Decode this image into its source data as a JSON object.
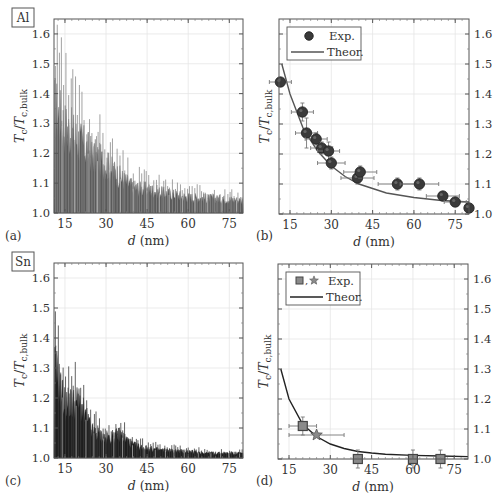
{
  "figure": {
    "panels": [
      {
        "id": "a",
        "label": "(a)",
        "material": "Al",
        "xlabel": "d (nm)",
        "ylabel": "Tc/Tc,bulk"
      },
      {
        "id": "b",
        "label": "(b)",
        "xlabel": "d (nm)",
        "ylabel": "Tc/Tc,bulk",
        "legend": [
          "Exp.",
          "Theor."
        ]
      },
      {
        "id": "c",
        "label": "(c)",
        "material": "Sn",
        "xlabel": "d (nm)",
        "ylabel": "Tc/Tc,bulk"
      },
      {
        "id": "d",
        "label": "(d)",
        "xlabel": "d (nm)",
        "ylabel": "Tc/Tc,bulk",
        "legend": [
          "Exp.",
          "Theor."
        ]
      }
    ]
  },
  "chart_data": [
    {
      "panel": "a",
      "type": "area",
      "title": "Al",
      "description": "Oscillating Tc/Tc,bulk vs film thickness (dense spiky curve, filled)",
      "xlabel": "d (nm)",
      "ylabel": "T_c / T_c,bulk",
      "xlim": [
        11,
        80
      ],
      "ylim": [
        1.0,
        1.65
      ],
      "xticks": [
        15,
        30,
        45,
        60,
        75
      ],
      "yticks": [
        1.0,
        1.1,
        1.2,
        1.3,
        1.4,
        1.5,
        1.6
      ],
      "grid": true,
      "envelope": {
        "x": [
          12,
          15,
          20,
          25,
          30,
          35,
          40,
          45,
          50,
          60,
          70,
          80
        ],
        "peak": [
          1.65,
          1.55,
          1.46,
          1.37,
          1.31,
          1.23,
          1.16,
          1.15,
          1.13,
          1.1,
          1.09,
          1.08
        ]
      }
    },
    {
      "panel": "b",
      "type": "scatter",
      "xlabel": "d (nm)",
      "ylabel": "T_c / T_c,bulk",
      "xlim": [
        11,
        80
      ],
      "ylim": [
        1.0,
        1.65
      ],
      "xticks": [
        15,
        30,
        45,
        60,
        75
      ],
      "yticks": [
        1.0,
        1.1,
        1.2,
        1.3,
        1.4,
        1.5,
        1.6
      ],
      "grid": true,
      "legend_position": "upper left",
      "series": [
        {
          "name": "Exp.",
          "marker": "circle",
          "x": [
            11.5,
            19.5,
            21,
            24.5,
            26.5,
            29,
            30,
            39.5,
            40.5,
            54,
            62,
            70.5,
            75,
            80
          ],
          "y": [
            1.44,
            1.34,
            1.27,
            1.25,
            1.22,
            1.21,
            1.17,
            1.12,
            1.14,
            1.1,
            1.1,
            1.06,
            1.04,
            1.02
          ],
          "xerr": [
            4,
            4,
            4,
            4,
            4,
            4,
            5,
            6,
            6,
            7,
            7,
            6,
            4,
            0
          ],
          "yerr": [
            0,
            0.03,
            0.05,
            0.02,
            0.02,
            0.03,
            0.02,
            0.02,
            0.02,
            0.02,
            0.02,
            0,
            0,
            0
          ]
        },
        {
          "name": "Theor.",
          "type": "line",
          "x": [
            12,
            15,
            20,
            25,
            30,
            35,
            40,
            45,
            50,
            60,
            70,
            80
          ],
          "y": [
            1.5,
            1.4,
            1.28,
            1.21,
            1.16,
            1.125,
            1.1,
            1.085,
            1.07,
            1.055,
            1.045,
            1.04
          ]
        }
      ]
    },
    {
      "panel": "c",
      "type": "area",
      "title": "Sn",
      "description": "Oscillating Tc/Tc,bulk vs film thickness (dense spiky curve, filled)",
      "xlabel": "d (nm)",
      "ylabel": "T_c / T_c,bulk",
      "xlim": [
        11,
        80
      ],
      "ylim": [
        1.0,
        1.65
      ],
      "xticks": [
        15,
        30,
        45,
        60,
        75
      ],
      "yticks": [
        1.0,
        1.1,
        1.2,
        1.3,
        1.4,
        1.5,
        1.6
      ],
      "grid": true,
      "envelope": {
        "x": [
          12,
          15,
          20,
          25,
          30,
          35,
          40,
          45,
          50,
          60,
          70,
          80
        ],
        "peak": [
          1.53,
          1.34,
          1.35,
          1.17,
          1.12,
          1.15,
          1.08,
          1.06,
          1.05,
          1.04,
          1.03,
          1.03
        ]
      }
    },
    {
      "panel": "d",
      "type": "scatter",
      "xlabel": "d (nm)",
      "ylabel": "T_c / T_c,bulk",
      "xlim": [
        11,
        80
      ],
      "ylim": [
        1.0,
        1.65
      ],
      "xticks": [
        15,
        30,
        45,
        60,
        75
      ],
      "yticks": [
        1.0,
        1.1,
        1.2,
        1.3,
        1.4,
        1.5,
        1.6
      ],
      "grid": true,
      "legend_position": "upper left",
      "series": [
        {
          "name": "Exp. (squares)",
          "marker": "square",
          "x": [
            20,
            40,
            60,
            70
          ],
          "y": [
            1.11,
            1.0,
            1.0,
            1.0
          ],
          "xerr": [
            5,
            0,
            0,
            0
          ],
          "yerr": [
            0.03,
            0.03,
            0.03,
            0.03
          ]
        },
        {
          "name": "Exp. (star)",
          "marker": "star",
          "x": [
            25
          ],
          "y": [
            1.08
          ],
          "xerr": [
            10
          ],
          "yerr": [
            0
          ]
        },
        {
          "name": "Theor.",
          "type": "line",
          "x": [
            12,
            15,
            20,
            25,
            30,
            35,
            40,
            45,
            50,
            60,
            70,
            80
          ],
          "y": [
            1.3,
            1.2,
            1.115,
            1.075,
            1.05,
            1.035,
            1.025,
            1.02,
            1.016,
            1.012,
            1.01,
            1.008
          ]
        }
      ]
    }
  ]
}
